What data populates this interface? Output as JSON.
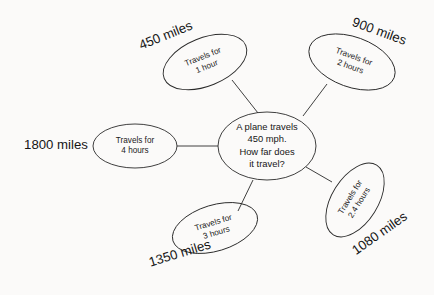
{
  "diagram": {
    "type": "mind-map",
    "center": {
      "lines": [
        "A plane travels",
        "450 mph.",
        "How far does",
        "it travel?"
      ],
      "cx": 267,
      "cy": 146,
      "rx": 49,
      "ry": 34
    },
    "branches": [
      {
        "id": "one-hour",
        "node_lines": [
          "Travels for",
          "1 hour"
        ],
        "answer": "450 miles",
        "cx": 205,
        "cy": 62,
        "rx": 44,
        "ry": 24,
        "rotation": -22,
        "answer_x": 166,
        "answer_y": 36,
        "answer_rotation": -22,
        "line": [
          232,
          80,
          258,
          113
        ]
      },
      {
        "id": "two-hours",
        "node_lines": [
          "Travels for",
          "2 hours"
        ],
        "answer": "900 miles",
        "cx": 352,
        "cy": 62,
        "rx": 45,
        "ry": 25,
        "rotation": 20,
        "answer_x": 379,
        "answer_y": 32,
        "answer_rotation": 20,
        "line": [
          327,
          84,
          303,
          116
        ]
      },
      {
        "id": "four-hours",
        "node_lines": [
          "Travels for",
          "4 hours"
        ],
        "answer": "1800 miles",
        "cx": 135,
        "cy": 146,
        "rx": 42,
        "ry": 22,
        "rotation": 0,
        "answer_x": 56,
        "answer_y": 146,
        "answer_rotation": 0,
        "line": [
          177,
          146,
          218,
          146
        ]
      },
      {
        "id": "twopointfour-hours",
        "node_lines": [
          "Travels for",
          "2.4 hours"
        ],
        "answer": "1080 miles",
        "cx": 355,
        "cy": 200,
        "rx": 41,
        "ry": 23,
        "rotation": -58,
        "answer_x": 380,
        "answer_y": 234,
        "answer_rotation": -35,
        "line": [
          332,
          182,
          306,
          167
        ]
      },
      {
        "id": "three-hours",
        "node_lines": [
          "Travels for",
          "3 hours"
        ],
        "answer": "1350 miles",
        "cx": 215,
        "cy": 228,
        "rx": 44,
        "ry": 23,
        "rotation": -17,
        "answer_x": 180,
        "answer_y": 254,
        "answer_rotation": -17,
        "line": [
          238,
          211,
          253,
          180
        ]
      }
    ],
    "colors": {
      "stroke": "#2a2a2a",
      "text": "#161616",
      "background": "#fbfaf9"
    }
  }
}
